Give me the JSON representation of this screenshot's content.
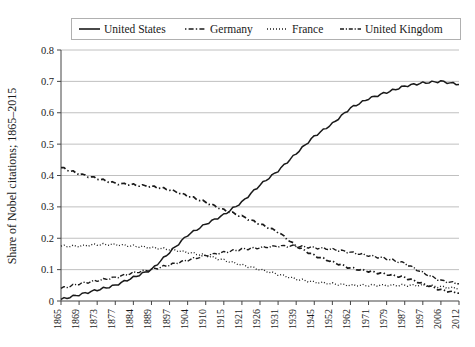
{
  "chart_data": {
    "type": "line",
    "title": "",
    "subtitle": "",
    "xlabel": "",
    "ylabel": "Share of Nobel citations; 1865–2015",
    "ylim": [
      0,
      0.8
    ],
    "ytick_labels": [
      "0",
      "0.1",
      "0.2",
      "0.3",
      "0.4",
      "0.5",
      "0.6",
      "0.7",
      "0.8"
    ],
    "ytick_values": [
      0,
      0.1,
      0.2,
      0.3,
      0.4,
      0.5,
      0.6,
      0.7,
      0.8
    ],
    "grid": "horizontal",
    "legend_position": "top",
    "categories": [
      "1865",
      "1869",
      "1873",
      "1877",
      "1884",
      "1889",
      "1897",
      "1904",
      "1910",
      "1915",
      "1921",
      "1926",
      "1931",
      "1939",
      "1945",
      "1952",
      "1962",
      "1971",
      "1979",
      "1987",
      "1997",
      "2006",
      "2012"
    ],
    "x": [
      1865,
      1869,
      1873,
      1877,
      1884,
      1889,
      1897,
      1904,
      1910,
      1915,
      1921,
      1926,
      1931,
      1939,
      1945,
      1952,
      1962,
      1971,
      1979,
      1987,
      1997,
      2006,
      2012
    ],
    "series": [
      {
        "name": "United States",
        "style": "solid",
        "values": [
          0.005,
          0.02,
          0.035,
          0.05,
          0.075,
          0.1,
          0.155,
          0.21,
          0.245,
          0.275,
          0.315,
          0.37,
          0.415,
          0.47,
          0.525,
          0.565,
          0.615,
          0.645,
          0.665,
          0.685,
          0.695,
          0.7,
          0.69
        ]
      },
      {
        "name": "Germany",
        "style": "dashed",
        "values": [
          0.425,
          0.405,
          0.39,
          0.375,
          0.37,
          0.365,
          0.355,
          0.335,
          0.315,
          0.29,
          0.27,
          0.245,
          0.22,
          0.175,
          0.145,
          0.125,
          0.105,
          0.095,
          0.085,
          0.075,
          0.055,
          0.035,
          0.025
        ]
      },
      {
        "name": "France",
        "style": "dotted",
        "values": [
          0.175,
          0.175,
          0.18,
          0.18,
          0.175,
          0.17,
          0.165,
          0.155,
          0.145,
          0.13,
          0.115,
          0.1,
          0.085,
          0.07,
          0.06,
          0.055,
          0.05,
          0.05,
          0.05,
          0.05,
          0.05,
          0.045,
          0.04
        ]
      },
      {
        "name": "United Kingdom",
        "style": "dashdot",
        "values": [
          0.04,
          0.055,
          0.065,
          0.075,
          0.09,
          0.1,
          0.115,
          0.13,
          0.145,
          0.155,
          0.165,
          0.17,
          0.175,
          0.175,
          0.17,
          0.165,
          0.155,
          0.145,
          0.135,
          0.12,
          0.09,
          0.065,
          0.055
        ]
      }
    ]
  },
  "legend": {
    "items": [
      {
        "label": "United States",
        "style": "solid"
      },
      {
        "label": "Germany",
        "style": "dashed"
      },
      {
        "label": "France",
        "style": "dotted"
      },
      {
        "label": "United Kingdom",
        "style": "dashdot"
      }
    ]
  },
  "colors": {
    "series": "#1a1a1a",
    "grid": "#b9b9b9",
    "axis": "#444444",
    "background": "#ffffff",
    "legend_border": "#b0b0b0"
  }
}
